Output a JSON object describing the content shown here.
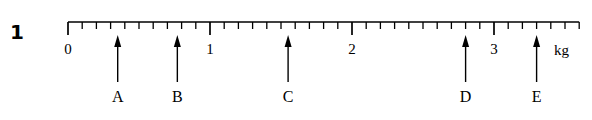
{
  "question": {
    "number": "1"
  },
  "scale": {
    "unit_label": "kg",
    "axis_start_value": 0,
    "axis_end_value": 3.6,
    "major_interval": 1,
    "minor_interval": 0.1,
    "major_tick_labels": [
      "0",
      "1",
      "2",
      "3"
    ],
    "major_tick_values": [
      0,
      1,
      2,
      3
    ],
    "line_color": "#000000"
  },
  "pointers": [
    {
      "label": "A",
      "value": 0.35
    },
    {
      "label": "B",
      "value": 0.77
    },
    {
      "label": "C",
      "value": 1.55
    },
    {
      "label": "D",
      "value": 2.8
    },
    {
      "label": "E",
      "value": 3.3
    }
  ],
  "chart_data": {
    "type": "line",
    "title": "",
    "xlabel": "kg",
    "ylabel": "",
    "xlim": [
      0,
      3.6
    ],
    "grid": false,
    "legend": "none",
    "categories": [
      "A",
      "B",
      "C",
      "D",
      "E"
    ],
    "values": [
      0.35,
      0.77,
      1.55,
      2.8,
      3.3
    ],
    "tick_labels": [
      "0",
      "1",
      "2",
      "3"
    ],
    "tick_values": [
      0,
      1,
      2,
      3
    ],
    "minor_tick_step": 0.1
  }
}
